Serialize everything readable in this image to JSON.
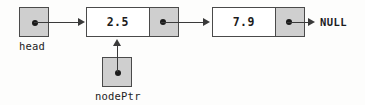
{
  "diagram": {
    "colors": {
      "pointer_cell_fill": "#cfcfcf",
      "data_cell_fill": "#ffffff",
      "border": "#4a4a4a",
      "line": "#3a3a3a",
      "text": "#1c1c1c",
      "background": "#fdfdfc"
    },
    "head_pointer": {
      "label": "head"
    },
    "nodes": [
      {
        "value": "2.5"
      },
      {
        "value": "7.9"
      }
    ],
    "terminator": {
      "label": "NULL"
    },
    "node_pointer": {
      "label": "nodePtr",
      "points_to_value": "2.5"
    }
  }
}
